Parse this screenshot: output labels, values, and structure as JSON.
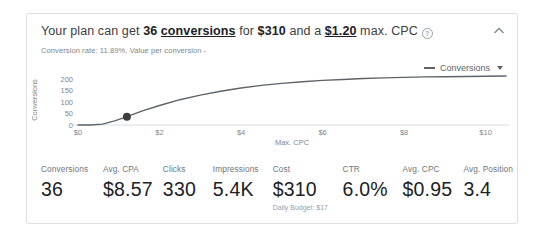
{
  "card": {
    "title": {
      "prefix": "Your plan can get ",
      "conversions_count": "36 ",
      "conversions_word": "conversions",
      "for_text": " for ",
      "cost": "$310",
      "and_text": " and a ",
      "max_cpc": "$1.20",
      "suffix": " max. CPC"
    },
    "help_icon_glyph": "?",
    "subtitle": "Conversion rate: 11.89%, Value per conversion -"
  },
  "chart": {
    "legend_label": "Conversions"
  },
  "chart_data": {
    "type": "line",
    "title": "",
    "xlabel": "Max. CPC",
    "ylabel": "Conversions",
    "xlim": [
      0,
      10.5
    ],
    "ylim": [
      0,
      225
    ],
    "yticks": [
      0,
      50,
      100,
      150,
      200
    ],
    "xticks": [
      0,
      2,
      4,
      6,
      8,
      10
    ],
    "xtick_labels": [
      "$0",
      "$2",
      "$4",
      "$6",
      "$8",
      "$10"
    ],
    "grid": false,
    "legend_position": "top-right",
    "series": [
      {
        "name": "Conversions",
        "color": "#5f6368",
        "x": [
          0,
          0.3,
          0.6,
          0.9,
          1.2,
          1.6,
          2,
          2.5,
          3,
          3.5,
          4,
          4.5,
          5,
          5.5,
          6,
          6.5,
          7,
          7.5,
          8,
          8.5,
          9,
          9.5,
          10,
          10.5
        ],
        "y": [
          0,
          0,
          4,
          18,
          36,
          62,
          85,
          110,
          130,
          147,
          161,
          172,
          181,
          188,
          194,
          198,
          202,
          205,
          207,
          209,
          210,
          211,
          212,
          213
        ]
      }
    ],
    "selected_point": {
      "x": 1.2,
      "y": 36
    }
  },
  "metrics": [
    {
      "label": "Conversions",
      "value": "36"
    },
    {
      "label": "Avg. CPA",
      "value": "$8.57"
    },
    {
      "label": "Clicks",
      "value": "330"
    },
    {
      "label": "Impressions",
      "value": "5.4K"
    },
    {
      "label": "Cost",
      "value": "$310",
      "sub": "Daily Budget: $17"
    },
    {
      "label": "CTR",
      "value": "6.0%"
    },
    {
      "label": "Avg. CPC",
      "value": "$0.95"
    },
    {
      "label": "Avg. Position",
      "value": "3.4"
    }
  ],
  "colors": {
    "line": "#5f6368",
    "marker": "#3c4043",
    "axis": "#dadce0",
    "tick_text": "#80868b",
    "border": "#e0e0e0"
  }
}
